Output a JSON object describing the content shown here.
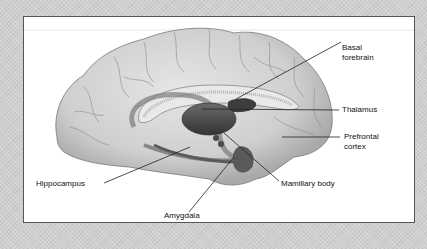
{
  "figure": {
    "labels": {
      "basal_forebrain_line1": "Basal",
      "basal_forebrain_line2": "forebrain",
      "thalamus": "Thalamus",
      "prefrontal_line1": "Prefrontal",
      "prefrontal_line2": "cortex",
      "hippocampus": "Hippocampus",
      "mamillary_body": "Mamillary body",
      "amygdala": "Amygdala"
    },
    "colors": {
      "background": "#cfcfcf",
      "frame_bg": "#ffffff",
      "frame_border": "#555555",
      "brain_fill": "#d6d6d6",
      "deep_structure": "#4a4a4a",
      "line": "#222222"
    }
  }
}
